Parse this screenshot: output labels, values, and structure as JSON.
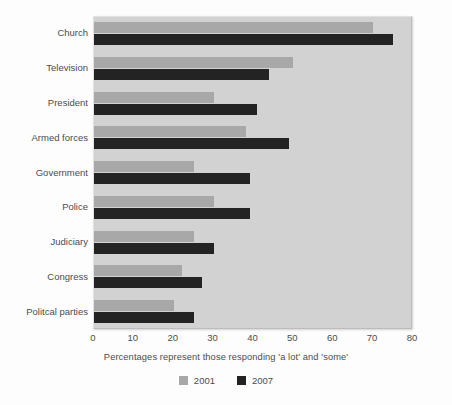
{
  "chart_data": {
    "type": "bar",
    "orientation": "horizontal",
    "title": "",
    "subtitle": "",
    "xlabel": "Percentages represent those responding 'a lot' and 'some'",
    "ylabel": "",
    "xlim": [
      0,
      80
    ],
    "xticks": [
      0,
      10,
      20,
      30,
      40,
      50,
      60,
      70,
      80
    ],
    "grid": false,
    "legend_position": "bottom",
    "categories": [
      "Church",
      "Television",
      "President",
      "Armed forces",
      "Government",
      "Police",
      "Judiciary",
      "Congress",
      "Politcal parties"
    ],
    "series": [
      {
        "name": "2001",
        "color": "#a8a8a8",
        "values": [
          70,
          50,
          30,
          38,
          25,
          30,
          25,
          22,
          20
        ]
      },
      {
        "name": "2007",
        "color": "#232323",
        "values": [
          75,
          44,
          41,
          49,
          39,
          39,
          30,
          27,
          25
        ]
      }
    ]
  },
  "axis": {
    "tick_labels": [
      "0",
      "10",
      "20",
      "30",
      "40",
      "50",
      "60",
      "70",
      "80"
    ]
  },
  "caption": {
    "text": "Percentages represent those responding 'a lot' and 'some'"
  },
  "legend": {
    "items": [
      {
        "label": "2001",
        "color": "#a8a8a8"
      },
      {
        "label": "2007",
        "color": "#232323"
      }
    ]
  },
  "colors": {
    "plot_background": "#d2d2d2",
    "page_background": "#fdfdfd",
    "series_2001": "#a8a8a8",
    "series_2007": "#232323",
    "text": "#4c4c4c"
  }
}
